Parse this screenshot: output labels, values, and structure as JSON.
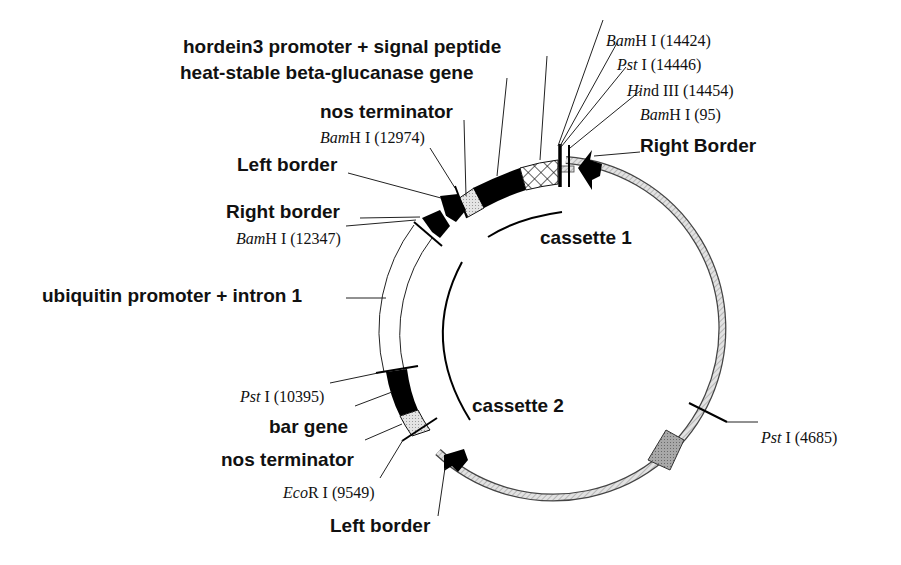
{
  "diagram": {
    "type": "plasmid-map",
    "colors": {
      "backbone_fill": "#cfcfcf",
      "backbone_stroke": "#444444",
      "block_black": "#000000",
      "block_light": "#d6d6d6",
      "block_gray": "#9a9a9a",
      "text": "#111111"
    },
    "features": {
      "hordein3_promoter": "hordein3 promoter + signal peptide",
      "beta_glucanase": "heat-stable beta-glucanase gene",
      "nos_terminator_1": "nos terminator",
      "left_border_top": "Left border",
      "right_border_top": "Right border",
      "ubiquitin_promoter": "ubiquitin promoter + intron 1",
      "bar_gene": "bar gene",
      "nos_terminator_2": "nos terminator",
      "left_border_bottom": "Left border",
      "right_border_main": "Right Border"
    },
    "cassettes": {
      "cassette1": "cassette 1",
      "cassette2": "cassette 2"
    },
    "sites": [
      {
        "id": "bamhi_14424",
        "enzyme_italic": "Bam",
        "enzyme_rest": "H I",
        "position": "(14424)"
      },
      {
        "id": "psti_14446",
        "enzyme_italic": "Pst",
        "enzyme_rest": " I",
        "position": "(14446)"
      },
      {
        "id": "hindiii_14454",
        "enzyme_italic": "Hin",
        "enzyme_rest": "d III",
        "position": "(14454)"
      },
      {
        "id": "bamhi_95",
        "enzyme_italic": "Bam",
        "enzyme_rest": "H I",
        "position": "(95)"
      },
      {
        "id": "bamhi_12974",
        "enzyme_italic": "Bam",
        "enzyme_rest": "H I",
        "position": "(12974)"
      },
      {
        "id": "bamhi_12347",
        "enzyme_italic": "Bam",
        "enzyme_rest": "H I",
        "position": "(12347)"
      },
      {
        "id": "psti_10395",
        "enzyme_italic": "Pst",
        "enzyme_rest": " I",
        "position": "(10395)"
      },
      {
        "id": "ecori_9549",
        "enzyme_italic": "Eco",
        "enzyme_rest": "R I",
        "position": "(9549)"
      },
      {
        "id": "psti_4685",
        "enzyme_italic": "Pst",
        "enzyme_rest": " I",
        "position": "(4685)"
      }
    ]
  }
}
